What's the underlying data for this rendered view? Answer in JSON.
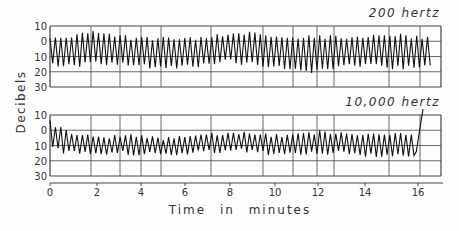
{
  "chart_data": {
    "type": "line",
    "ylabel": "Decibels",
    "xlabel": "Time in minutes",
    "x_ticks": [
      0,
      2,
      4,
      6,
      8,
      10,
      12,
      14,
      16
    ],
    "x_range": [
      0,
      17.4
    ],
    "y_ticks": [
      "10",
      "0",
      "10",
      "20",
      "30"
    ],
    "y_range": [
      -10,
      30
    ],
    "y_inverted": true,
    "grid": true,
    "panels": [
      {
        "title": "200 hertz",
        "series": [
          {
            "name": "200 hertz",
            "center": 8,
            "amplitude_range": [
              -8,
              18
            ],
            "description": "rapid oscillation between about -5 and 17 dB over 0-17 min"
          }
        ],
        "upper_envelope": [
          [
            0,
            -2
          ],
          [
            1,
            -3
          ],
          [
            2,
            -6
          ],
          [
            3,
            -3
          ],
          [
            4,
            -2
          ],
          [
            5,
            -2
          ],
          [
            6,
            -1
          ],
          [
            7,
            -2
          ],
          [
            8,
            -5
          ],
          [
            9,
            -5
          ],
          [
            10,
            -3
          ],
          [
            11,
            -2
          ],
          [
            12,
            -3
          ],
          [
            13,
            -3
          ],
          [
            14,
            -2
          ],
          [
            15,
            -5
          ],
          [
            16,
            -3
          ],
          [
            17,
            -3
          ]
        ],
        "lower_envelope": [
          [
            0,
            15
          ],
          [
            1,
            16
          ],
          [
            2,
            14
          ],
          [
            3,
            15
          ],
          [
            4,
            16
          ],
          [
            5,
            17
          ],
          [
            6,
            16
          ],
          [
            7,
            16
          ],
          [
            8,
            13
          ],
          [
            9,
            15
          ],
          [
            10,
            16
          ],
          [
            11,
            18
          ],
          [
            12,
            20
          ],
          [
            13,
            16
          ],
          [
            14,
            16
          ],
          [
            15,
            17
          ],
          [
            16,
            17
          ],
          [
            17,
            16
          ]
        ]
      },
      {
        "title": "10,000 hertz",
        "series": [
          {
            "name": "10,000 hertz",
            "center": 10,
            "description": "oscillation between about 2 and 17 dB, spike to -10 at ~16.5 min"
          }
        ],
        "upper_envelope": [
          [
            0,
            -5
          ],
          [
            0.3,
            -2
          ],
          [
            1,
            3
          ],
          [
            2,
            4
          ],
          [
            3,
            4
          ],
          [
            4,
            4
          ],
          [
            5,
            5
          ],
          [
            6,
            4
          ],
          [
            7,
            2
          ],
          [
            8,
            2
          ],
          [
            9,
            2
          ],
          [
            10,
            4
          ],
          [
            11,
            3
          ],
          [
            12,
            1
          ],
          [
            13,
            2
          ],
          [
            14,
            3
          ],
          [
            15,
            2
          ],
          [
            16,
            2
          ],
          [
            16.3,
            3
          ]
        ],
        "lower_envelope": [
          [
            0,
            12
          ],
          [
            1,
            15
          ],
          [
            2,
            15
          ],
          [
            3,
            15
          ],
          [
            4,
            15
          ],
          [
            5,
            16
          ],
          [
            6,
            15
          ],
          [
            7,
            14
          ],
          [
            8,
            13
          ],
          [
            9,
            14
          ],
          [
            10,
            15
          ],
          [
            11,
            16
          ],
          [
            12,
            15
          ],
          [
            13,
            15
          ],
          [
            14,
            16
          ],
          [
            15,
            16
          ],
          [
            16,
            16
          ],
          [
            16.3,
            15
          ]
        ],
        "spike": {
          "x_start": 16.3,
          "y_start": 14,
          "x_end": 16.6,
          "y_end": -10
        }
      }
    ]
  },
  "labels": {
    "ylabel": "Decibels",
    "xlabel": "Time in minutes",
    "panel1_title": "200 hertz",
    "panel2_title": "10,000 hertz"
  },
  "layout": {
    "plot_left": 50,
    "plot_right": 441,
    "panels_top": [
      26,
      115
    ],
    "panel_height": 61,
    "vgrid_x": [
      50,
      91,
      120,
      141,
      161,
      211,
      263,
      293,
      317,
      334,
      389,
      420,
      441
    ],
    "axis_y": 183,
    "tick_x": [
      50,
      97,
      141,
      185,
      230,
      275,
      318,
      365,
      418
    ]
  }
}
